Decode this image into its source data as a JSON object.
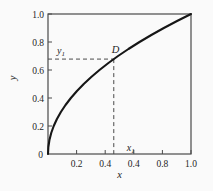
{
  "chart_data": {
    "type": "line",
    "title": "",
    "xlabel": "x",
    "ylabel": "y",
    "xlim": [
      0,
      1
    ],
    "ylim": [
      0,
      1
    ],
    "grid": false,
    "frame": "box",
    "x_ticks": [
      0.2,
      0.4,
      0.6,
      0.8,
      1.0
    ],
    "x_tick_labels": [
      "0.2",
      "0.4",
      "0.4",
      "0.8",
      "1.0"
    ],
    "y_ticks": [
      0.2,
      0.4,
      0.6,
      0.8,
      1.0
    ],
    "y_tick_labels": [
      "0.2",
      "0.4",
      "0.6",
      "0.8",
      "1.0"
    ],
    "origin_label": "0",
    "series": [
      {
        "name": "y = sqrt(x)",
        "points": [
          [
            0,
            0
          ],
          [
            0.0025,
            0.05
          ],
          [
            0.01,
            0.1
          ],
          [
            0.0225,
            0.15
          ],
          [
            0.04,
            0.2
          ],
          [
            0.0625,
            0.25
          ],
          [
            0.09,
            0.3
          ],
          [
            0.1225,
            0.35
          ],
          [
            0.16,
            0.4
          ],
          [
            0.2025,
            0.45
          ],
          [
            0.25,
            0.5
          ],
          [
            0.3025,
            0.55
          ],
          [
            0.36,
            0.6
          ],
          [
            0.4225,
            0.65
          ],
          [
            0.49,
            0.7
          ],
          [
            0.5625,
            0.75
          ],
          [
            0.64,
            0.8
          ],
          [
            0.7225,
            0.85
          ],
          [
            0.81,
            0.9
          ],
          [
            0.9025,
            0.95
          ],
          [
            1,
            1
          ]
        ]
      }
    ],
    "marked_point": {
      "x": 0.46,
      "y": 0.678,
      "label": "D"
    },
    "guide_labels": {
      "y_base": "y",
      "y_sub": "1",
      "x_base": "x",
      "x_sub": "1"
    },
    "colors": {
      "curve": "#161616",
      "axis": "#4a4a4a",
      "dashed": "#4a4a4a",
      "text": "#1e1e1e",
      "background": "#fafafa"
    }
  }
}
